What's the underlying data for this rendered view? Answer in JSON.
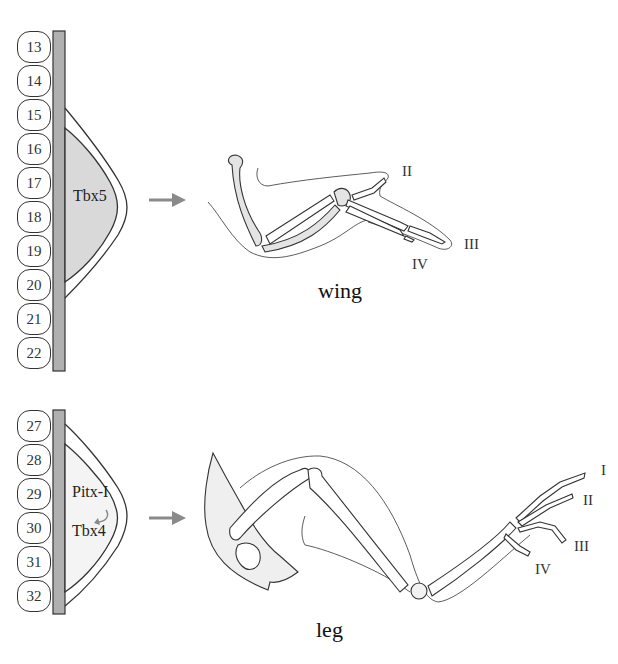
{
  "figure": {
    "top_panel": {
      "somites": [
        "13",
        "14",
        "15",
        "16",
        "17",
        "18",
        "19",
        "20",
        "21",
        "22"
      ],
      "gene_label": "Tbx5",
      "limb_caption": "wing",
      "digit_labels": [
        "II",
        "III",
        "IV"
      ],
      "field_fill": "#d9d9d9"
    },
    "bottom_panel": {
      "somites": [
        "27",
        "28",
        "29",
        "30",
        "31",
        "32"
      ],
      "gene_label_upstream": "Pitx-I",
      "gene_label_downstream": "Tbx4",
      "limb_caption": "leg",
      "digit_labels": [
        "I",
        "II",
        "III",
        "IV"
      ],
      "field_fill": "#f4f4f4"
    },
    "colors": {
      "arrow": "#8a8a8a",
      "neural_tube": "#b0b0b0",
      "outline": "#333333"
    }
  }
}
